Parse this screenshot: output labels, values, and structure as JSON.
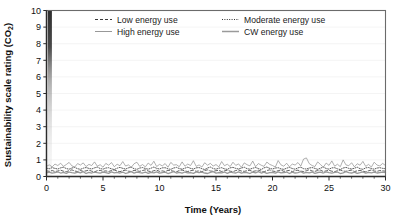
{
  "chart_data": {
    "type": "line",
    "title": "",
    "xlabel": "Time (Years)",
    "ylabel": "Sustainability scale rating (CO2)",
    "ylabel_main": "Sustainability scale rating (CO",
    "ylabel_sub": "2",
    "ylabel_tail": ")",
    "xlim": [
      0,
      30
    ],
    "ylim": [
      0,
      10
    ],
    "xticks": [
      0,
      5,
      10,
      15,
      20,
      25,
      30
    ],
    "yticks": [
      0,
      1,
      2,
      3,
      4,
      5,
      6,
      7,
      8,
      9,
      10
    ],
    "xtick_labels": [
      "0",
      "5",
      "10",
      "15",
      "20",
      "25",
      "30"
    ],
    "ytick_labels": [
      "0",
      "1",
      "2",
      "3",
      "4",
      "5",
      "6",
      "7",
      "8",
      "9",
      "10"
    ],
    "xtick_minor_step": 1,
    "grid": "horizontal-light",
    "grid_color": "#ededed",
    "frame_color": "#6b6b6b",
    "legend_position": "top-inside",
    "legend_border_color": "#6b6b6b",
    "x": [
      0,
      0.25,
      0.5,
      0.75,
      1,
      1.25,
      1.5,
      1.75,
      2,
      2.25,
      2.5,
      2.75,
      3,
      3.25,
      3.5,
      3.75,
      4,
      4.25,
      4.5,
      4.75,
      5,
      5.25,
      5.5,
      5.75,
      6,
      6.25,
      6.5,
      6.75,
      7,
      7.25,
      7.5,
      7.75,
      8,
      8.25,
      8.5,
      8.75,
      9,
      9.25,
      9.5,
      9.75,
      10,
      10.25,
      10.5,
      10.75,
      11,
      11.25,
      11.5,
      11.75,
      12,
      12.25,
      12.5,
      12.75,
      13,
      13.25,
      13.5,
      13.75,
      14,
      14.25,
      14.5,
      14.75,
      15,
      15.25,
      15.5,
      15.75,
      16,
      16.25,
      16.5,
      16.75,
      17,
      17.25,
      17.5,
      17.75,
      18,
      18.25,
      18.5,
      18.75,
      19,
      19.25,
      19.5,
      19.75,
      20,
      20.25,
      20.5,
      20.75,
      21,
      21.25,
      21.5,
      21.75,
      22,
      22.25,
      22.5,
      22.75,
      23,
      23.25,
      23.5,
      23.75,
      24,
      24.25,
      24.5,
      24.75,
      25,
      25.25,
      25.5,
      25.75,
      26,
      26.25,
      26.5,
      26.75,
      27,
      27.25,
      27.5,
      27.75,
      28,
      28.25,
      28.5,
      28.75,
      29,
      29.25,
      29.5,
      29.75,
      30
    ],
    "series": [
      {
        "name": "Low energy use",
        "style": "dashed",
        "color": "#3a3a3a",
        "width": 0.8,
        "dash": "3,2",
        "values": [
          0.34,
          0.31,
          0.36,
          0.3,
          0.33,
          0.38,
          0.32,
          0.29,
          0.35,
          0.4,
          0.33,
          0.3,
          0.36,
          0.31,
          0.34,
          0.39,
          0.32,
          0.28,
          0.35,
          0.37,
          0.31,
          0.34,
          0.3,
          0.36,
          0.39,
          0.33,
          0.29,
          0.35,
          0.38,
          0.32,
          0.3,
          0.37,
          0.34,
          0.31,
          0.36,
          0.4,
          0.33,
          0.29,
          0.35,
          0.38,
          0.31,
          0.34,
          0.3,
          0.37,
          0.35,
          0.32,
          0.28,
          0.36,
          0.39,
          0.33,
          0.3,
          0.35,
          0.38,
          0.31,
          0.34,
          0.29,
          0.36,
          0.4,
          0.33,
          0.31,
          0.35,
          0.37,
          0.3,
          0.34,
          0.38,
          0.32,
          0.29,
          0.36,
          0.39,
          0.33,
          0.31,
          0.35,
          0.37,
          0.3,
          0.34,
          0.38,
          0.32,
          0.28,
          0.36,
          0.4,
          0.33,
          0.3,
          0.35,
          0.39,
          0.31,
          0.34,
          0.37,
          0.29,
          0.36,
          0.38,
          0.32,
          0.3,
          0.35,
          0.41,
          0.33,
          0.31,
          0.36,
          0.38,
          0.3,
          0.34,
          0.37,
          0.32,
          0.29,
          0.35,
          0.39,
          0.33,
          0.31,
          0.36,
          0.38,
          0.3,
          0.34,
          0.37,
          0.32,
          0.28,
          0.35,
          0.39,
          0.33,
          0.31,
          0.36,
          0.34,
          0.32
        ]
      },
      {
        "name": "Moderate energy use",
        "style": "dotted",
        "color": "#333333",
        "width": 0.8,
        "dash": "1,1.4",
        "values": [
          0.5,
          0.47,
          0.53,
          0.49,
          0.45,
          0.52,
          0.56,
          0.48,
          0.44,
          0.51,
          0.55,
          0.47,
          0.43,
          0.5,
          0.54,
          0.49,
          0.45,
          0.52,
          0.57,
          0.48,
          0.44,
          0.51,
          0.53,
          0.46,
          0.42,
          0.5,
          0.55,
          0.49,
          0.45,
          0.52,
          0.56,
          0.47,
          0.43,
          0.51,
          0.54,
          0.48,
          0.44,
          0.5,
          0.57,
          0.49,
          0.45,
          0.52,
          0.53,
          0.46,
          0.43,
          0.51,
          0.55,
          0.48,
          0.44,
          0.5,
          0.56,
          0.49,
          0.45,
          0.52,
          0.54,
          0.47,
          0.42,
          0.51,
          0.57,
          0.48,
          0.44,
          0.5,
          0.53,
          0.46,
          0.43,
          0.52,
          0.55,
          0.49,
          0.45,
          0.51,
          0.56,
          0.47,
          0.44,
          0.5,
          0.54,
          0.48,
          0.42,
          0.52,
          0.57,
          0.49,
          0.45,
          0.51,
          0.53,
          0.46,
          0.43,
          0.5,
          0.55,
          0.48,
          0.44,
          0.52,
          0.56,
          0.47,
          0.45,
          0.51,
          0.54,
          0.49,
          0.43,
          0.5,
          0.57,
          0.48,
          0.44,
          0.52,
          0.53,
          0.46,
          0.42,
          0.51,
          0.55,
          0.49,
          0.45,
          0.5,
          0.56,
          0.47,
          0.43,
          0.52,
          0.54,
          0.48,
          0.44,
          0.51,
          0.53,
          0.49,
          0.47
        ]
      },
      {
        "name": "High energy use",
        "style": "solid-thin",
        "color": "#8c8c8c",
        "width": 0.7,
        "dash": "none",
        "values": [
          0.62,
          0.7,
          0.58,
          0.75,
          0.66,
          0.8,
          0.61,
          0.72,
          0.85,
          0.64,
          0.57,
          0.78,
          0.69,
          0.82,
          0.6,
          0.73,
          0.66,
          0.88,
          0.62,
          0.71,
          0.56,
          0.79,
          0.68,
          0.84,
          0.59,
          0.74,
          0.65,
          0.9,
          0.63,
          0.7,
          0.55,
          0.77,
          0.86,
          0.61,
          0.72,
          0.58,
          0.81,
          0.67,
          0.92,
          0.6,
          0.73,
          0.64,
          0.78,
          0.56,
          0.85,
          0.69,
          0.71,
          0.59,
          0.88,
          0.62,
          0.75,
          0.66,
          0.95,
          0.61,
          0.7,
          0.57,
          0.83,
          0.68,
          0.79,
          0.63,
          0.72,
          0.58,
          0.9,
          0.65,
          0.74,
          0.6,
          0.86,
          0.67,
          0.76,
          0.55,
          0.82,
          0.71,
          0.64,
          0.93,
          0.59,
          0.78,
          0.68,
          0.61,
          0.87,
          0.73,
          0.66,
          0.57,
          0.96,
          0.7,
          0.62,
          0.8,
          0.58,
          0.75,
          0.69,
          0.84,
          0.63,
          1.05,
          1.12,
          0.78,
          0.66,
          0.6,
          0.88,
          0.72,
          0.56,
          0.81,
          0.67,
          0.94,
          0.62,
          0.74,
          0.59,
          1.0,
          0.7,
          0.65,
          0.83,
          0.58,
          0.77,
          0.68,
          0.91,
          0.61,
          0.73,
          0.57,
          0.86,
          0.69,
          0.64,
          0.79,
          0.66
        ]
      },
      {
        "name": "CW energy use",
        "style": "solid-thick",
        "color": "#9a9a9a",
        "width": 1.3,
        "dash": "none",
        "values": [
          0.22,
          0.26,
          0.2,
          0.24,
          0.28,
          0.21,
          0.25,
          0.19,
          0.27,
          0.23,
          0.2,
          0.26,
          0.22,
          0.29,
          0.18,
          0.25,
          0.21,
          0.27,
          0.23,
          0.2,
          0.26,
          0.24,
          0.19,
          0.28,
          0.22,
          0.25,
          0.21,
          0.27,
          0.18,
          0.24,
          0.29,
          0.2,
          0.26,
          0.23,
          0.21,
          0.27,
          0.19,
          0.25,
          0.22,
          0.28,
          0.2,
          0.24,
          0.26,
          0.18,
          0.23,
          0.29,
          0.21,
          0.25,
          0.2,
          0.27,
          0.22,
          0.24,
          0.19,
          0.28,
          0.23,
          0.26,
          0.21,
          0.18,
          0.25,
          0.29,
          0.2,
          0.24,
          0.22,
          0.27,
          0.19,
          0.26,
          0.23,
          0.21,
          0.28,
          0.2,
          0.25,
          0.24,
          0.18,
          0.27,
          0.22,
          0.29,
          0.21,
          0.26,
          0.19,
          0.23,
          0.25,
          0.2,
          0.28,
          0.22,
          0.24,
          0.27,
          0.18,
          0.26,
          0.21,
          0.23,
          0.29,
          0.2,
          0.25,
          0.22,
          0.27,
          0.19,
          0.24,
          0.26,
          0.21,
          0.28,
          0.23,
          0.2,
          0.25,
          0.27,
          0.18,
          0.22,
          0.29,
          0.24,
          0.21,
          0.26,
          0.19,
          0.23,
          0.28,
          0.2,
          0.25,
          0.22,
          0.27,
          0.21,
          0.24,
          0.26,
          0.23
        ]
      }
    ]
  },
  "legend": {
    "items": [
      {
        "label": "Low energy use"
      },
      {
        "label": "Moderate energy use"
      },
      {
        "label": "High energy use"
      },
      {
        "label": "CW energy use"
      }
    ]
  }
}
